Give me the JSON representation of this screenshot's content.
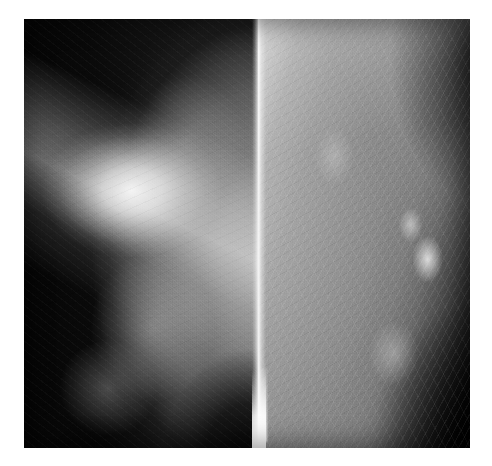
{
  "page": {
    "background_color": "#ffffff",
    "width": 492,
    "height": 466,
    "caption": ""
  },
  "figure": {
    "kind": "medical-radiograph",
    "modality": "mammogram",
    "layout": "side-by-side-pair",
    "frame": {
      "x": 24,
      "y": 19,
      "width": 446,
      "height": 429
    },
    "background_color": "#000000",
    "divider": {
      "name": "film-seam",
      "x": 234,
      "width": 14,
      "color": "#fcfcfc",
      "description": "bright vertical strip where the two films abut"
    },
    "panels": [
      {
        "id": "left",
        "label": "",
        "width": 234,
        "background_color": "#070707",
        "tissue_side": "right",
        "description": "dense breast; tissue fills the right two-thirds, dark film background at left",
        "findings": [
          {
            "name": "dominant-mass",
            "brightness": "very-bright",
            "center_pct": {
              "x": 46,
              "y": 40
            },
            "color": "#f5f5f5"
          },
          {
            "name": "glandular-density",
            "brightness": "bright",
            "center_pct": {
              "x": 55,
              "y": 72
            },
            "color": "#bebebe"
          },
          {
            "name": "pectoral-wedge",
            "brightness": "bright",
            "angle_deg": 205,
            "color": "#bebebe"
          },
          {
            "name": "inferior-dark-corner",
            "brightness": "dark",
            "center_pct": {
              "x": 96,
              "y": 104
            },
            "color": "#000000"
          }
        ]
      },
      {
        "id": "right",
        "label": "",
        "width": 212,
        "background_color": "#0a0a0a",
        "tissue_side": "left",
        "description": "fattier breast; bright at the chest-wall (left) edge fading to dark background at right, fibroglandular striations visible",
        "findings": [
          {
            "name": "chest-wall-bright-band",
            "brightness": "very-bright",
            "color": "#d2d2d2"
          },
          {
            "name": "parenchyma-midtone",
            "brightness": "mid-gray",
            "color": "#888888"
          },
          {
            "name": "nodular-density",
            "brightness": "bright",
            "center_pct": {
              "x": 80,
              "y": 56
            },
            "color": "#f0f0f0"
          },
          {
            "name": "skin-line",
            "brightness": "bright",
            "color": "#ffffff"
          },
          {
            "name": "dark-background",
            "brightness": "dark",
            "color": "#050505"
          }
        ]
      }
    ],
    "palette": {
      "film_black": "#050505",
      "background_dark": "#0a0a0a",
      "tissue_dark": "#3a3a3a",
      "tissue_mid": "#888888",
      "tissue_light": "#bcbcbc",
      "highlight": "#f5f5f5",
      "paper_white": "#ffffff"
    }
  }
}
